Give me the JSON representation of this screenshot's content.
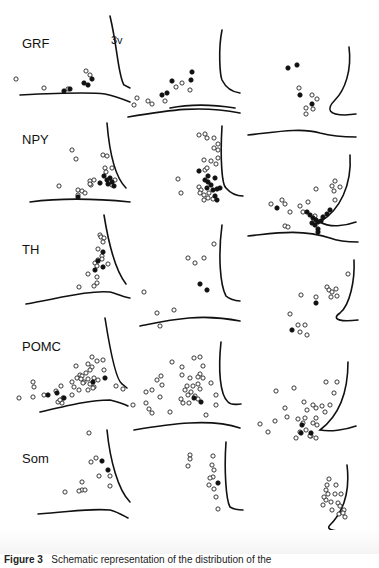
{
  "figure": {
    "row_labels": [
      "GRF",
      "NPY",
      "TH",
      "POMC",
      "Som"
    ],
    "ventricle_label": "3v",
    "caption_prefix": "Figure 3",
    "caption_text": "Schematic representation of the distribution of the"
  },
  "legend": {
    "open_circle": "open-circle-cell",
    "filled_circle": "filled-circle-cell"
  },
  "panels": [
    {
      "row": 0,
      "col": 0,
      "wall": "M110,16 C118,50 118,75 124,85 L130,88",
      "floor": "M20,95 C60,93 90,92 105,94 C115,96 125,100 130,102",
      "open": [
        [
          16,
          79
        ],
        [
          44,
          88
        ],
        [
          68,
          89
        ],
        [
          86,
          71
        ],
        [
          90,
          75
        ]
      ],
      "filled": [
        [
          64,
          91
        ],
        [
          70,
          89
        ],
        [
          92,
          79
        ],
        [
          84,
          83
        ],
        [
          88,
          85
        ]
      ]
    },
    {
      "row": 0,
      "col": 1,
      "wall": "M222,30 C218,50 220,75 222,80 C226,88 232,92 240,93",
      "floor": "M170,108 C190,104 210,104 235,108",
      "open": [
        [
          137,
          98
        ],
        [
          134,
          105
        ],
        [
          148,
          101
        ],
        [
          152,
          104
        ],
        [
          165,
          101
        ],
        [
          176,
          87
        ],
        [
          182,
          83
        ],
        [
          190,
          90
        ]
      ],
      "filled": [
        [
          162,
          95
        ],
        [
          167,
          93
        ],
        [
          172,
          81
        ],
        [
          191,
          80
        ],
        [
          192,
          72
        ]
      ]
    },
    {
      "row": 0,
      "col": 2,
      "wall": "M349,47 C352,70 345,90 335,100 C325,110 330,115 345,115 L356,114",
      "floor": "",
      "open": [
        [
          299,
          88
        ],
        [
          312,
          95
        ],
        [
          317,
          99
        ],
        [
          306,
          108
        ],
        [
          313,
          109
        ],
        [
          306,
          114
        ]
      ],
      "filled": [
        [
          288,
          68
        ],
        [
          297,
          65
        ],
        [
          300,
          95
        ],
        [
          312,
          104
        ]
      ]
    },
    {
      "row": 1,
      "col": 0,
      "wall": "M107,123 C110,160 118,180 126,188",
      "floor": "M30,202 C60,198 90,198 130,202",
      "open": [
        [
          72,
          150
        ],
        [
          76,
          159
        ],
        [
          59,
          186
        ],
        [
          103,
          155
        ],
        [
          107,
          156
        ],
        [
          105,
          168
        ],
        [
          106,
          172
        ],
        [
          112,
          168
        ],
        [
          90,
          181
        ],
        [
          91,
          185
        ],
        [
          94,
          180
        ],
        [
          78,
          190
        ],
        [
          82,
          191
        ],
        [
          78,
          195
        ],
        [
          85,
          193
        ],
        [
          90,
          184
        ],
        [
          115,
          180
        ],
        [
          112,
          185
        ]
      ],
      "filled": [
        [
          107,
          180
        ],
        [
          110,
          178
        ],
        [
          104,
          176
        ],
        [
          100,
          183
        ],
        [
          112,
          182
        ],
        [
          108,
          184
        ],
        [
          114,
          186
        ],
        [
          78,
          197
        ]
      ]
    },
    {
      "row": 1,
      "col": 1,
      "wall": "M222,126 C220,160 222,185 226,188 C232,195 238,196 243,196",
      "floor": "M128,117 C170,110 200,105 240,113",
      "open": [
        [
          199,
          135
        ],
        [
          205,
          134
        ],
        [
          207,
          138
        ],
        [
          214,
          138
        ],
        [
          218,
          144
        ],
        [
          214,
          148
        ],
        [
          218,
          150
        ],
        [
          204,
          160
        ],
        [
          211,
          161
        ],
        [
          216,
          164
        ],
        [
          218,
          158
        ],
        [
          205,
          170
        ],
        [
          207,
          168
        ],
        [
          178,
          179
        ],
        [
          181,
          193
        ],
        [
          199,
          187
        ],
        [
          201,
          190
        ],
        [
          200,
          193
        ],
        [
          204,
          195
        ],
        [
          209,
          193
        ],
        [
          213,
          199
        ],
        [
          208,
          198
        ],
        [
          204,
          200
        ]
      ],
      "filled": [
        [
          199,
          171
        ],
        [
          208,
          176
        ],
        [
          215,
          178
        ],
        [
          208,
          182
        ],
        [
          211,
          185
        ],
        [
          207,
          188
        ],
        [
          213,
          190
        ],
        [
          217,
          189
        ],
        [
          220,
          188
        ],
        [
          215,
          196
        ],
        [
          217,
          200
        ],
        [
          205,
          180
        ]
      ]
    },
    {
      "row": 2,
      "col": 2,
      "wall": "M350,155 C352,185 340,210 320,222 C330,228 345,226 356,222",
      "floor": "M248,135 C270,133 300,127 320,133 C335,137 350,137 356,137",
      "open": [
        [
          271,
          204
        ],
        [
          282,
          200
        ],
        [
          285,
          204
        ],
        [
          308,
          202
        ],
        [
          316,
          189
        ],
        [
          334,
          191
        ],
        [
          332,
          186
        ],
        [
          335,
          181
        ],
        [
          340,
          187
        ],
        [
          335,
          200
        ],
        [
          300,
          206
        ],
        [
          303,
          212
        ],
        [
          290,
          212
        ],
        [
          315,
          216
        ],
        [
          285,
          226
        ],
        [
          288,
          227
        ]
      ],
      "filled": [
        [
          277,
          208
        ],
        [
          307,
          212
        ],
        [
          310,
          215
        ],
        [
          313,
          218
        ],
        [
          316,
          220
        ],
        [
          318,
          222
        ],
        [
          321,
          221
        ],
        [
          315,
          225
        ],
        [
          318,
          229
        ],
        [
          323,
          217
        ],
        [
          327,
          214
        ],
        [
          330,
          210
        ],
        [
          312,
          223
        ],
        [
          318,
          232
        ]
      ]
    },
    {
      "row": 2,
      "col": 0,
      "wall": "M104,215 C108,240 115,270 126,284",
      "floor": "M26,304 C60,298 90,290 110,292 C118,294 126,298 130,298",
      "open": [
        [
          100,
          235
        ],
        [
          101,
          237
        ],
        [
          104,
          238
        ],
        [
          103,
          242
        ],
        [
          98,
          249
        ],
        [
          102,
          256
        ],
        [
          98,
          260
        ],
        [
          102,
          259
        ],
        [
          95,
          263
        ],
        [
          97,
          266
        ],
        [
          108,
          264
        ],
        [
          88,
          274
        ],
        [
          97,
          277
        ],
        [
          97,
          283
        ],
        [
          94,
          286
        ],
        [
          79,
          287
        ]
      ],
      "filled": [
        [
          103,
          252
        ],
        [
          98,
          261
        ],
        [
          103,
          267
        ],
        [
          95,
          270
        ]
      ]
    },
    {
      "row": 2,
      "col": 1,
      "wall": "M222,225 C218,255 220,285 226,296 C228,298 234,301 240,301",
      "floor": "M140,326 C170,320 200,313 240,321",
      "open": [
        [
          214,
          244
        ],
        [
          188,
          258
        ],
        [
          195,
          263
        ],
        [
          204,
          258
        ],
        [
          144,
          292
        ],
        [
          157,
          313
        ],
        [
          160,
          326
        ],
        [
          174,
          310
        ]
      ],
      "filled": [
        [
          200,
          284
        ],
        [
          207,
          290
        ]
      ]
    },
    {
      "row": 2,
      "col": 2,
      "wall": "M354,260 C355,280 350,305 340,313 C330,320 342,322 358,320",
      "floor": "M248,236 C270,234 300,228 330,238 C340,242 355,242 358,242",
      "open": [
        [
          348,
          274
        ],
        [
          327,
          287
        ],
        [
          329,
          290
        ],
        [
          336,
          289
        ],
        [
          332,
          292
        ],
        [
          331,
          297
        ],
        [
          337,
          296
        ],
        [
          301,
          295
        ],
        [
          316,
          297
        ],
        [
          290,
          314
        ],
        [
          298,
          325
        ],
        [
          305,
          325
        ],
        [
          300,
          332
        ],
        [
          307,
          335
        ]
      ],
      "filled": [
        [
          316,
          303
        ],
        [
          292,
          330
        ]
      ]
    },
    {
      "row": 3,
      "col": 0,
      "wall": "M105,318 C110,350 116,380 122,384 L127,388",
      "floor": "M40,412 C70,405 90,400 110,400 C118,402 124,404 128,406",
      "open": [
        [
          92,
          357
        ],
        [
          97,
          361
        ],
        [
          103,
          360
        ],
        [
          104,
          370
        ],
        [
          76,
          366
        ],
        [
          88,
          364
        ],
        [
          92,
          367
        ],
        [
          86,
          373
        ],
        [
          80,
          375
        ],
        [
          77,
          378
        ],
        [
          90,
          370
        ],
        [
          88,
          379
        ],
        [
          84,
          382
        ],
        [
          82,
          376
        ],
        [
          94,
          378
        ],
        [
          98,
          380
        ],
        [
          72,
          382
        ],
        [
          74,
          387
        ],
        [
          81,
          379
        ],
        [
          90,
          384
        ],
        [
          72,
          395
        ],
        [
          79,
          390
        ],
        [
          56,
          391
        ],
        [
          61,
          386
        ],
        [
          94,
          387
        ],
        [
          63,
          398
        ],
        [
          88,
          390
        ],
        [
          93,
          388
        ],
        [
          62,
          403
        ],
        [
          58,
          402
        ],
        [
          33,
          382
        ],
        [
          34,
          387
        ],
        [
          19,
          398
        ],
        [
          33,
          397
        ],
        [
          44,
          395
        ],
        [
          60,
          400
        ],
        [
          83,
          383
        ],
        [
          116,
          386
        ],
        [
          123,
          389
        ]
      ],
      "filled": [
        [
          105,
          378
        ],
        [
          57,
          393
        ],
        [
          64,
          398
        ],
        [
          48,
          395
        ],
        [
          93,
          382
        ]
      ]
    },
    {
      "row": 3,
      "col": 1,
      "wall": "M221,342 C218,370 220,395 228,402 C232,406 238,404 241,404",
      "floor": "M134,430 C170,424 210,418 240,428",
      "open": [
        [
          172,
          362
        ],
        [
          194,
          358
        ],
        [
          200,
          357
        ],
        [
          203,
          366
        ],
        [
          200,
          374
        ],
        [
          203,
          378
        ],
        [
          198,
          384
        ],
        [
          200,
          389
        ],
        [
          198,
          377
        ],
        [
          182,
          367
        ],
        [
          182,
          375
        ],
        [
          190,
          378
        ],
        [
          187,
          386
        ],
        [
          193,
          386
        ],
        [
          191,
          392
        ],
        [
          185,
          390
        ],
        [
          181,
          399
        ],
        [
          188,
          395
        ],
        [
          195,
          396
        ],
        [
          198,
          399
        ],
        [
          189,
          403
        ],
        [
          161,
          376
        ],
        [
          157,
          380
        ],
        [
          152,
          390
        ],
        [
          146,
          403
        ],
        [
          162,
          385
        ],
        [
          160,
          397
        ],
        [
          149,
          409
        ],
        [
          152,
          413
        ],
        [
          133,
          405
        ],
        [
          146,
          392
        ],
        [
          211,
          383
        ],
        [
          216,
          395
        ],
        [
          216,
          405
        ],
        [
          183,
          403
        ],
        [
          170,
          412
        ],
        [
          206,
          415
        ]
      ],
      "filled": [
        [
          194,
          398
        ],
        [
          201,
          402
        ]
      ]
    },
    {
      "row": 3,
      "col": 2,
      "wall": "M348,362 C348,390 340,415 320,430 C330,432 345,430 356,426",
      "floor": "",
      "open": [
        [
          276,
          391
        ],
        [
          294,
          388
        ],
        [
          326,
          382
        ],
        [
          337,
          382
        ],
        [
          334,
          393
        ],
        [
          304,
          402
        ],
        [
          313,
          405
        ],
        [
          316,
          408
        ],
        [
          322,
          406
        ],
        [
          307,
          410
        ],
        [
          285,
          408
        ],
        [
          275,
          421
        ],
        [
          287,
          417
        ],
        [
          298,
          419
        ],
        [
          303,
          423
        ],
        [
          316,
          418
        ],
        [
          313,
          423
        ],
        [
          317,
          425
        ],
        [
          306,
          430
        ],
        [
          300,
          432
        ],
        [
          311,
          436
        ],
        [
          316,
          438
        ],
        [
          296,
          438
        ],
        [
          260,
          424
        ],
        [
          268,
          432
        ],
        [
          310,
          436
        ],
        [
          305,
          418
        ],
        [
          325,
          412
        ],
        [
          330,
          405
        ]
      ],
      "filled": [
        [
          301,
          433
        ],
        [
          311,
          433
        ],
        [
          302,
          425
        ]
      ]
    },
    {
      "row": 4,
      "col": 0,
      "wall": "M107,430 C110,460 118,490 130,502",
      "floor": "M38,514 C70,512 90,508 110,510 C118,512 124,516 128,518",
      "open": [
        [
          89,
          433
        ],
        [
          91,
          462
        ],
        [
          96,
          458
        ],
        [
          99,
          476
        ],
        [
          110,
          476
        ],
        [
          110,
          486
        ],
        [
          82,
          482
        ],
        [
          82,
          490
        ],
        [
          79,
          491
        ],
        [
          85,
          490
        ],
        [
          65,
          492
        ]
      ],
      "filled": [
        [
          102,
          461
        ],
        [
          108,
          470
        ]
      ]
    },
    {
      "row": 4,
      "col": 1,
      "wall": "M226,442 C224,470 226,500 230,507 C233,509 238,510 243,510",
      "floor": "M146,537 C170,533 200,528 240,534",
      "open": [
        [
          190,
          455
        ],
        [
          190,
          459
        ],
        [
          188,
          466
        ],
        [
          213,
          456
        ],
        [
          212,
          465
        ],
        [
          214,
          470
        ],
        [
          213,
          477
        ],
        [
          210,
          478
        ],
        [
          209,
          485
        ],
        [
          214,
          489
        ],
        [
          216,
          497
        ],
        [
          218,
          509
        ]
      ],
      "filled": [
        [
          218,
          483
        ]
      ]
    },
    {
      "row": 4,
      "col": 2,
      "wall": "M347,465 C350,490 345,510 330,525 C325,530 335,532 356,532",
      "floor": "M278,546 C300,544 320,545 358,548",
      "open": [
        [
          329,
          479
        ],
        [
          327,
          485
        ],
        [
          326,
          490
        ],
        [
          336,
          485
        ],
        [
          328,
          494
        ],
        [
          326,
          500
        ],
        [
          331,
          502
        ],
        [
          338,
          503
        ],
        [
          341,
          494
        ],
        [
          335,
          494
        ],
        [
          332,
          510
        ],
        [
          340,
          506
        ],
        [
          344,
          510
        ],
        [
          339,
          514
        ],
        [
          343,
          513
        ],
        [
          345,
          517
        ],
        [
          324,
          497
        ],
        [
          323,
          505
        ]
      ],
      "filled": []
    }
  ]
}
